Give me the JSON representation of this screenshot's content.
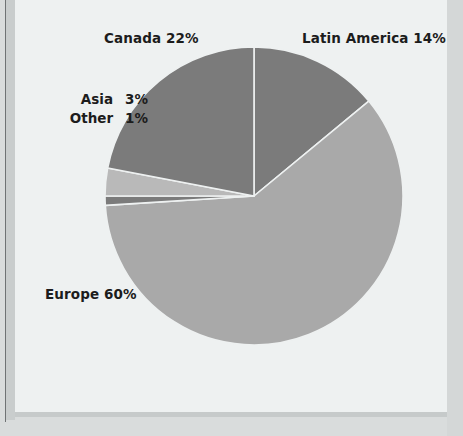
{
  "figure": {
    "background_color": "#eef1f1",
    "page_border_color": "#6f7374"
  },
  "chart_data": {
    "type": "pie",
    "title": "",
    "categories": [
      "Latin America",
      "Europe",
      "Other",
      "Asia",
      "Canada"
    ],
    "values": [
      14,
      60,
      1,
      3,
      22
    ],
    "unit": "%",
    "start_angle_deg": 90,
    "direction": "clockwise",
    "legend": "none",
    "labels_position": "outside",
    "slices": [
      {
        "name": "Latin America",
        "value": 14,
        "label": "Latin America 14%",
        "color": "#7b7b7b"
      },
      {
        "name": "Europe",
        "value": 60,
        "label": "Europe 60%",
        "color": "#a9a9a9"
      },
      {
        "name": "Other",
        "value": 1,
        "label": "Other",
        "value_text": "1%",
        "color": "#7b7b7b"
      },
      {
        "name": "Asia",
        "value": 3,
        "label": "Asia",
        "value_text": "3%",
        "color": "#b9b9b9"
      },
      {
        "name": "Canada",
        "value": 22,
        "label": "Canada 22%",
        "color": "#7b7b7b"
      }
    ]
  },
  "labels": {
    "canada": "Canada 22%",
    "latin_america": "Latin America 14%",
    "europe": "Europe 60%",
    "asia_name": "Asia",
    "asia_value": "3%",
    "other_name": "Other",
    "other_value": "1%"
  }
}
